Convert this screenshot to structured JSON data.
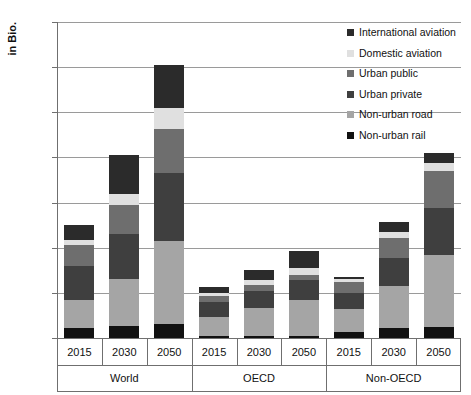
{
  "chart_data": {
    "type": "bar",
    "subtype": "stacked-bar-grouped",
    "title": "",
    "xlabel": "",
    "ylabel": "in Bio.",
    "ylim": [
      0,
      140
    ],
    "yticks": [
      0,
      20,
      40,
      60,
      80,
      100,
      120,
      140
    ],
    "grid": true,
    "legend_position": "top-right",
    "categories": [
      "2015",
      "2030",
      "2050",
      "2015",
      "2030",
      "2050",
      "2015",
      "2030",
      "2050"
    ],
    "groups": [
      {
        "name": "World",
        "years": [
          "2015",
          "2030",
          "2050"
        ]
      },
      {
        "name": "OECD",
        "years": [
          "2015",
          "2030",
          "2050"
        ]
      },
      {
        "name": "Non-OECD",
        "years": [
          "2015",
          "2030",
          "2050"
        ]
      }
    ],
    "series": [
      {
        "name": "Non-urban rail",
        "color": "#111111",
        "values": [
          4.5,
          5.5,
          6.0,
          1.0,
          1.0,
          1.0,
          2.5,
          4.5,
          5.0
        ]
      },
      {
        "name": "Non-urban road",
        "color": "#a5a5a5",
        "values": [
          12.5,
          20.5,
          37.0,
          8.5,
          12.5,
          16.0,
          10.5,
          18.5,
          32.0
        ]
      },
      {
        "name": "Urban private",
        "color": "#3f3f3f",
        "values": [
          15.0,
          20.0,
          30.0,
          6.5,
          7.5,
          8.5,
          7.0,
          12.5,
          20.5
        ]
      },
      {
        "name": "Urban public",
        "color": "#6e6e6e",
        "values": [
          9.0,
          13.0,
          19.5,
          2.5,
          2.5,
          2.5,
          5.0,
          9.0,
          16.5
        ]
      },
      {
        "name": "Domestic aviation",
        "color": "#e0e0e0",
        "values": [
          2.5,
          5.0,
          9.5,
          1.5,
          2.0,
          3.0,
          1.0,
          2.5,
          3.5
        ]
      },
      {
        "name": "International aviation",
        "color": "#2b2b2b",
        "values": [
          6.5,
          17.0,
          19.0,
          2.5,
          4.5,
          7.5,
          1.0,
          4.5,
          4.5
        ]
      }
    ],
    "totals": [
      50.0,
      81.0,
      121.0,
      22.5,
      30.0,
      38.5,
      27.0,
      51.5,
      82.0
    ],
    "legend_entries": [
      "International aviation",
      "Domestic aviation",
      "Urban public",
      "Urban private",
      "Non-urban road",
      "Non-urban rail"
    ]
  },
  "axis": {
    "y_title": "in Bio."
  }
}
